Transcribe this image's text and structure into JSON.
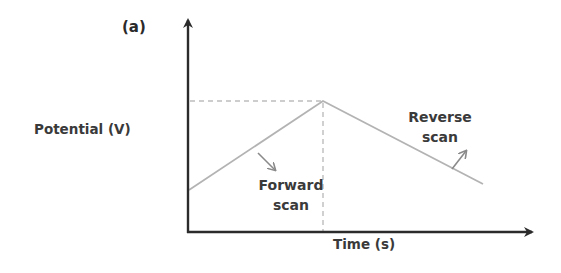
{
  "figure": {
    "panel_label": "(a)",
    "y_axis_label": "Potential (V)",
    "x_axis_label": "Time (s)",
    "annotations": {
      "forward": {
        "line1": "Forward",
        "line2": "scan"
      },
      "reverse": {
        "line1": "Reverse",
        "line2": "scan"
      }
    },
    "colors": {
      "axis": "#2b2b2b",
      "waveform": "#b3b3b3",
      "guide_dashes": "#bdbdbd",
      "arrows": "#8a8a8a",
      "text": "#3a3a3a"
    }
  },
  "diagram_data": {
    "type": "triangular potential waveform (cyclic voltammetry)",
    "segments": [
      {
        "name": "Forward scan",
        "direction": "increasing potential",
        "from": "start potential",
        "to": "vertex potential"
      },
      {
        "name": "Reverse scan",
        "direction": "decreasing potential",
        "from": "vertex potential",
        "to": "end potential"
      }
    ],
    "guides": [
      "horizontal dashed line from vertex to potential axis",
      "vertical dashed line from vertex to time axis"
    ]
  }
}
